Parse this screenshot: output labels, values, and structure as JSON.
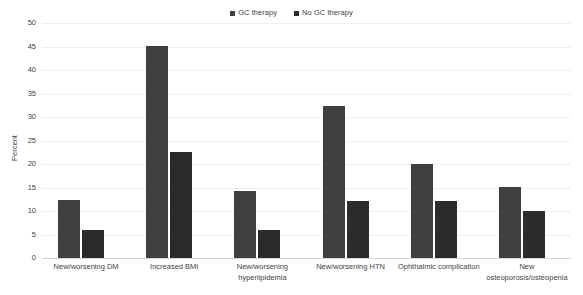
{
  "chart_data": {
    "type": "bar",
    "title": "",
    "xlabel": "",
    "ylabel": "Percent",
    "ylim": [
      0,
      50
    ],
    "yticks": [
      0,
      5,
      10,
      15,
      20,
      25,
      30,
      35,
      40,
      45,
      50
    ],
    "ytick_labels": [
      "0",
      "5",
      "10",
      "15",
      "20",
      "25",
      "30",
      "35",
      "40",
      "45",
      "50"
    ],
    "grid": true,
    "legend_position": "top-center",
    "categories": [
      "New/worsening DM",
      "Increased BMI",
      "New/worsening hyperlipidemia",
      "New/worsening HTN",
      "Ophthalmic complication",
      "New osteoporosis/osteopenia"
    ],
    "category_lines": [
      [
        "New/worsening DM"
      ],
      [
        "Increased BMI"
      ],
      [
        "New/worsening",
        "hyperlipidemia"
      ],
      [
        "New/worsening HTN"
      ],
      [
        "Ophthalmic complication"
      ],
      [
        "New",
        "osteoporosis/osteopenia"
      ]
    ],
    "series": [
      {
        "name": "GC therapy",
        "color": "#404040",
        "values": [
          12.4,
          45.1,
          14.2,
          32.3,
          19.9,
          15.1
        ]
      },
      {
        "name": "No GC therapy",
        "color": "#2b2b2b",
        "values": [
          6.0,
          22.6,
          6.0,
          12.1,
          12.1,
          10.0
        ]
      }
    ]
  },
  "legend": {
    "entries": [
      {
        "label": "GC therapy",
        "color": "#404040",
        "marker": "square-marker"
      },
      {
        "label": "No GC therapy",
        "color": "#2b2b2b",
        "marker": "square-marker"
      }
    ]
  },
  "axes": {
    "y_title": "Percent"
  }
}
